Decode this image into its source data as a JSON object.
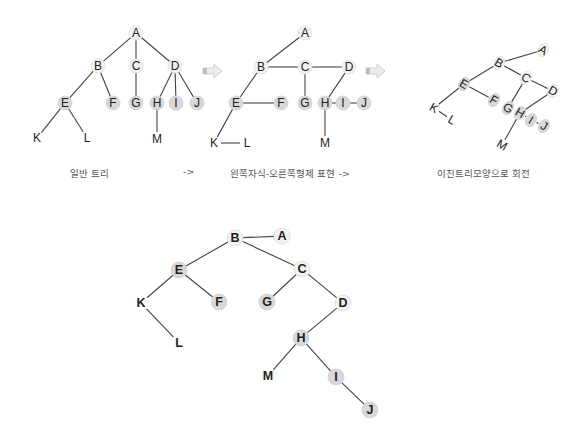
{
  "colors": {
    "edge": "#444444",
    "node_fill_light": "#f2f2f2",
    "node_fill_gray": "#d8d8d8",
    "text": "#222222",
    "caption": "#555555",
    "arrow": "#cccccc"
  },
  "captions": {
    "general_tree": "일반 트리",
    "arrow1": "->",
    "lcrs": "왼쪽자식-오른쪽형제 표현 ->",
    "rotated": "이진트리모양으로 회전"
  },
  "diagrams": {
    "general_tree": {
      "title": "일반 트리",
      "nodes": [
        {
          "id": "A",
          "x": 136,
          "y": 33,
          "shade": "light"
        },
        {
          "id": "B",
          "x": 98,
          "y": 66,
          "shade": "light"
        },
        {
          "id": "C",
          "x": 136,
          "y": 66,
          "shade": "light"
        },
        {
          "id": "D",
          "x": 175,
          "y": 66,
          "shade": "light"
        },
        {
          "id": "E",
          "x": 65,
          "y": 103,
          "shade": "gray"
        },
        {
          "id": "F",
          "x": 113,
          "y": 103,
          "shade": "gray"
        },
        {
          "id": "G",
          "x": 136,
          "y": 103,
          "shade": "gray"
        },
        {
          "id": "H",
          "x": 157,
          "y": 103,
          "shade": "gray"
        },
        {
          "id": "I",
          "x": 176,
          "y": 103,
          "shade": "gray"
        },
        {
          "id": "J",
          "x": 197,
          "y": 103,
          "shade": "gray"
        },
        {
          "id": "K",
          "x": 37,
          "y": 138,
          "shade": "none"
        },
        {
          "id": "L",
          "x": 87,
          "y": 138,
          "shade": "none"
        },
        {
          "id": "M",
          "x": 157,
          "y": 139,
          "shade": "none"
        }
      ],
      "edges": [
        [
          "A",
          "B"
        ],
        [
          "A",
          "C"
        ],
        [
          "A",
          "D"
        ],
        [
          "B",
          "E"
        ],
        [
          "B",
          "F"
        ],
        [
          "C",
          "G"
        ],
        [
          "D",
          "H"
        ],
        [
          "D",
          "I"
        ],
        [
          "D",
          "J"
        ],
        [
          "E",
          "K"
        ],
        [
          "E",
          "L"
        ],
        [
          "H",
          "M"
        ]
      ]
    },
    "lcrs_tree": {
      "title": "왼쪽자식-오른쪽형제 표현",
      "nodes": [
        {
          "id": "A",
          "x": 305,
          "y": 33,
          "shade": "light"
        },
        {
          "id": "B",
          "x": 261,
          "y": 67,
          "shade": "light"
        },
        {
          "id": "C",
          "x": 305,
          "y": 67,
          "shade": "light"
        },
        {
          "id": "D",
          "x": 349,
          "y": 67,
          "shade": "light"
        },
        {
          "id": "E",
          "x": 236,
          "y": 103,
          "shade": "gray"
        },
        {
          "id": "F",
          "x": 281,
          "y": 103,
          "shade": "gray"
        },
        {
          "id": "G",
          "x": 305,
          "y": 103,
          "shade": "gray"
        },
        {
          "id": "H",
          "x": 325,
          "y": 103,
          "shade": "gray"
        },
        {
          "id": "I",
          "x": 343,
          "y": 103,
          "shade": "gray"
        },
        {
          "id": "J",
          "x": 364,
          "y": 103,
          "shade": "gray"
        },
        {
          "id": "K",
          "x": 214,
          "y": 143,
          "shade": "none"
        },
        {
          "id": "L",
          "x": 247,
          "y": 143,
          "shade": "none"
        },
        {
          "id": "M",
          "x": 325,
          "y": 143,
          "shade": "none"
        }
      ],
      "edges": [
        [
          "A",
          "B"
        ],
        [
          "B",
          "C"
        ],
        [
          "C",
          "D"
        ],
        [
          "B",
          "E"
        ],
        [
          "E",
          "F"
        ],
        [
          "C",
          "G"
        ],
        [
          "D",
          "H"
        ],
        [
          "H",
          "I"
        ],
        [
          "I",
          "J"
        ],
        [
          "E",
          "K"
        ],
        [
          "K",
          "L"
        ],
        [
          "H",
          "M"
        ]
      ]
    },
    "rotated_tree": {
      "title": "이진트리모양으로 회전",
      "nodes": [
        {
          "id": "A",
          "x": 543,
          "y": 50,
          "shade": "light"
        },
        {
          "id": "B",
          "x": 499,
          "y": 63,
          "shade": "light"
        },
        {
          "id": "C",
          "x": 526,
          "y": 78,
          "shade": "light"
        },
        {
          "id": "D",
          "x": 553,
          "y": 91,
          "shade": "light"
        },
        {
          "id": "E",
          "x": 464,
          "y": 84,
          "shade": "gray"
        },
        {
          "id": "F",
          "x": 494,
          "y": 100,
          "shade": "gray"
        },
        {
          "id": "G",
          "x": 508,
          "y": 108,
          "shade": "gray"
        },
        {
          "id": "H",
          "x": 520,
          "y": 113,
          "shade": "gray"
        },
        {
          "id": "I",
          "x": 531,
          "y": 120,
          "shade": "gray"
        },
        {
          "id": "J",
          "x": 544,
          "y": 126,
          "shade": "gray"
        },
        {
          "id": "K",
          "x": 434,
          "y": 108,
          "shade": "none"
        },
        {
          "id": "L",
          "x": 452,
          "y": 120,
          "shade": "none"
        },
        {
          "id": "M",
          "x": 502,
          "y": 145,
          "shade": "none"
        }
      ],
      "edges": [
        [
          "A",
          "B"
        ],
        [
          "B",
          "C"
        ],
        [
          "C",
          "D"
        ],
        [
          "B",
          "E"
        ],
        [
          "E",
          "F"
        ],
        [
          "C",
          "G"
        ],
        [
          "D",
          "H"
        ],
        [
          "H",
          "I"
        ],
        [
          "I",
          "J"
        ],
        [
          "E",
          "K"
        ],
        [
          "K",
          "L"
        ],
        [
          "H",
          "M"
        ]
      ]
    },
    "binary_tree": {
      "title": "",
      "nodes": [
        {
          "id": "A",
          "x": 282,
          "y": 236,
          "shade": "light"
        },
        {
          "id": "B",
          "x": 235,
          "y": 238,
          "shade": "light"
        },
        {
          "id": "C",
          "x": 302,
          "y": 269,
          "shade": "light"
        },
        {
          "id": "D",
          "x": 343,
          "y": 303,
          "shade": "light"
        },
        {
          "id": "E",
          "x": 179,
          "y": 270,
          "shade": "gray"
        },
        {
          "id": "F",
          "x": 219,
          "y": 302,
          "shade": "gray"
        },
        {
          "id": "G",
          "x": 267,
          "y": 302,
          "shade": "gray"
        },
        {
          "id": "H",
          "x": 301,
          "y": 338,
          "shade": "gray"
        },
        {
          "id": "I",
          "x": 336,
          "y": 377,
          "shade": "gray"
        },
        {
          "id": "J",
          "x": 370,
          "y": 410,
          "shade": "gray"
        },
        {
          "id": "K",
          "x": 141,
          "y": 303,
          "shade": "none"
        },
        {
          "id": "L",
          "x": 179,
          "y": 343,
          "shade": "none"
        },
        {
          "id": "M",
          "x": 268,
          "y": 376,
          "shade": "none"
        }
      ],
      "edges": [
        [
          "A",
          "B"
        ],
        [
          "B",
          "E"
        ],
        [
          "B",
          "C"
        ],
        [
          "E",
          "K"
        ],
        [
          "E",
          "F"
        ],
        [
          "C",
          "G"
        ],
        [
          "C",
          "D"
        ],
        [
          "K",
          "L"
        ],
        [
          "D",
          "H"
        ],
        [
          "H",
          "M"
        ],
        [
          "H",
          "I"
        ],
        [
          "I",
          "J"
        ]
      ]
    }
  }
}
